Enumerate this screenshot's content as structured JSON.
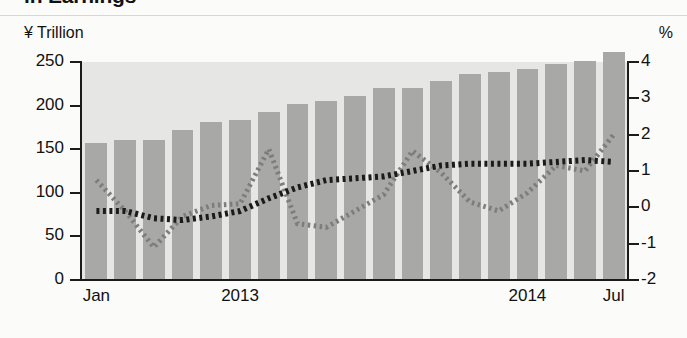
{
  "title_partial": "in Earnings",
  "axes": {
    "left_caption": "¥ Trillion",
    "right_caption": "%"
  },
  "chart_data": {
    "type": "bar",
    "title": "in Earnings",
    "xlabel": "",
    "ylabel": "¥ Trillion",
    "y2label": "%",
    "ylim": [
      0,
      270
    ],
    "y2lim": [
      -2,
      4
    ],
    "grid": false,
    "legend": "none",
    "left_ticks": [
      "0",
      "50",
      "100",
      "150",
      "200",
      "250"
    ],
    "left_tick_values": [
      0,
      50,
      100,
      150,
      200,
      250
    ],
    "right_ticks": [
      "-2",
      "-1",
      "0",
      "1",
      "2",
      "3",
      "4"
    ],
    "right_tick_values": [
      -2,
      -1,
      0,
      1,
      2,
      3,
      4
    ],
    "x_tick_labels": [
      "Jan",
      "2013",
      "2014",
      "Jul"
    ],
    "x_tick_positions": [
      0,
      5,
      15,
      18
    ],
    "categories": [
      "Jan 2013",
      "Feb 2013",
      "Mar 2013",
      "Apr 2013",
      "May 2013",
      "Jun 2013",
      "Jul 2013",
      "Aug 2013",
      "Sep 2013",
      "Oct 2013",
      "Nov 2013",
      "Dec 2013",
      "Jan 2014",
      "Feb 2014",
      "Mar 2014",
      "Apr 2014",
      "May 2014",
      "Jun 2014",
      "Jul 2014"
    ],
    "series": [
      {
        "name": "Earnings",
        "type": "bar",
        "axis": "left",
        "unit": "¥ Trillion",
        "color": "#a8a8a6",
        "values": [
          157,
          160,
          161,
          172,
          181,
          184,
          193,
          202,
          205,
          211,
          220,
          220,
          228,
          236,
          238,
          242,
          248,
          251,
          262
        ]
      },
      {
        "name": "Black dotted line",
        "type": "line",
        "style": "dotted",
        "axis": "right",
        "unit": "%",
        "color": "#1b1b1b",
        "values": [
          -0.1,
          -0.1,
          -0.3,
          -0.35,
          -0.25,
          -0.1,
          0.25,
          0.55,
          0.75,
          0.8,
          0.85,
          1.0,
          1.15,
          1.2,
          1.2,
          1.2,
          1.25,
          1.3,
          1.25
        ]
      },
      {
        "name": "Gray dotted line",
        "type": "line",
        "style": "dotted",
        "axis": "right",
        "unit": "%",
        "color": "#7d7d7b",
        "values": [
          0.75,
          -0.1,
          -1.1,
          -0.25,
          0.05,
          0.1,
          1.6,
          -0.45,
          -0.55,
          -0.1,
          0.35,
          1.55,
          0.95,
          0.15,
          -0.1,
          0.4,
          1.15,
          1.0,
          2.0
        ]
      }
    ]
  }
}
